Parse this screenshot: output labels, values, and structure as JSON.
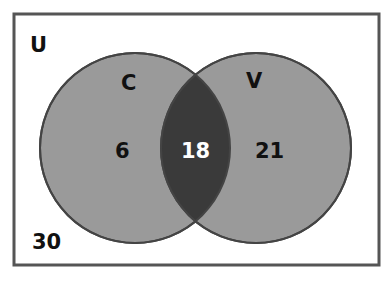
{
  "diagram": {
    "type": "venn",
    "universe_label": "U",
    "outside_count": "30",
    "sets": [
      {
        "label": "C",
        "only_count": "6"
      },
      {
        "label": "V",
        "only_count": "21"
      }
    ],
    "intersection_count": "18",
    "colors": {
      "circle_fill": "#9a9a9a",
      "intersection_fill": "#3a3a3a",
      "border": "#444444",
      "intersection_text": "#ffffff"
    }
  }
}
